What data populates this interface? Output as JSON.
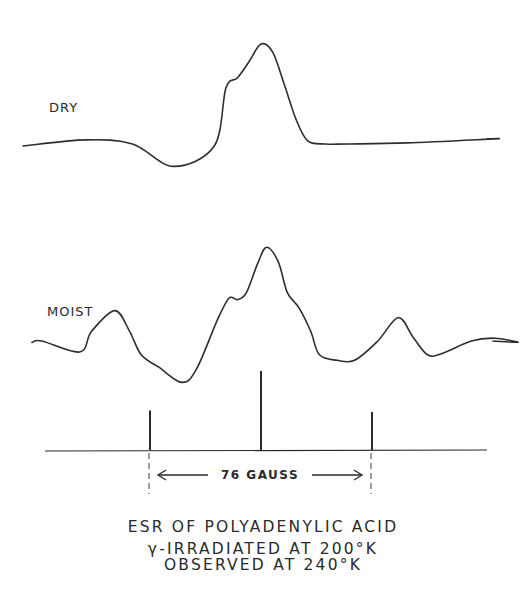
{
  "chart_data": {
    "type": "line",
    "title": "ESR OF POLYADENYLIC ACID",
    "subtitle_lines": [
      "γ-IRRADIATED AT 200°K",
      "OBSERVED AT 240°K"
    ],
    "xlabel": "",
    "ylabel": "",
    "grid": false,
    "legend": "none",
    "x_range_gauss": [
      -100,
      100
    ],
    "series": [
      {
        "name": "DRY",
        "label": "DRY",
        "x": [
          -100,
          -60,
          -44,
          -30,
          -16,
          -12,
          -8,
          -4,
          0,
          4,
          8,
          12,
          16,
          22,
          30,
          50,
          80,
          100
        ],
        "y": [
          0.0,
          0.06,
          0.02,
          -0.2,
          0.0,
          0.57,
          0.67,
          0.83,
          1.0,
          0.92,
          0.6,
          0.26,
          0.05,
          0.02,
          0.02,
          0.03,
          0.07,
          0.07
        ]
      },
      {
        "name": "MOIST",
        "label": "MOIST",
        "x": [
          -100,
          -75,
          -62,
          -58,
          -50,
          -45,
          -41,
          -35,
          -27,
          -22,
          -15,
          -11,
          -8,
          -5,
          -1,
          2,
          6,
          9,
          13,
          17,
          20,
          26,
          32,
          40,
          47,
          52,
          57,
          62,
          72,
          80,
          88,
          100
        ],
        "y": [
          -0.01,
          0.0,
          -0.08,
          0.07,
          0.22,
          0.07,
          -0.1,
          -0.19,
          -0.3,
          -0.2,
          0.15,
          0.31,
          0.3,
          0.35,
          0.57,
          0.68,
          0.57,
          0.35,
          0.24,
          0.07,
          -0.1,
          -0.14,
          -0.14,
          0.0,
          0.17,
          0.03,
          -0.1,
          -0.09,
          0.0,
          0.02,
          -0.01,
          0.0
        ]
      }
    ],
    "stick_spectrum": {
      "positions_gauss": [
        -38,
        0,
        38
      ],
      "relative_intensities": [
        0.5,
        1.0,
        0.48
      ]
    },
    "annotations": {
      "scale_bar_label": "76 GAUSS",
      "scale_bar_span_gauss": 76
    }
  }
}
